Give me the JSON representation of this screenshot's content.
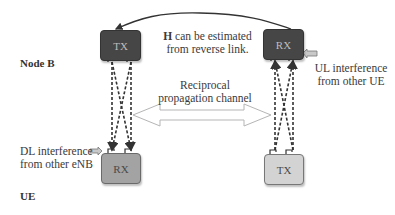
{
  "diagram": {
    "labels": {
      "node_b": "Node B",
      "ue": "UE",
      "h_estimate_line1_bold": "H",
      "h_estimate_line1_rest": " can be estimated",
      "h_estimate_line2": "from reverse link.",
      "reciprocal_line1": "Reciprocal",
      "reciprocal_line2": "propagation channel",
      "ul_interference_line1": "UL interference",
      "ul_interference_line2": "from other UE",
      "dl_interference_line1": "DL interference",
      "dl_interference_line2": "from other eNB"
    },
    "blocks": {
      "nodeb_tx": "TX",
      "nodeb_rx": "RX",
      "ue_rx": "RX",
      "ue_tx": "TX"
    },
    "colors": {
      "dark_block": "#464646",
      "mid_block": "#a3a3a3",
      "light_block": "#d3d3d3",
      "arrow": "#333333",
      "hollow_arrow_stroke": "#b5b5b5",
      "interference_arrow": "#c8c8c8"
    }
  }
}
